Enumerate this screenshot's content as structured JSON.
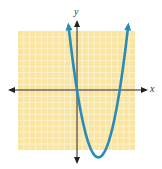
{
  "chart_data": {
    "type": "line",
    "title": "",
    "xlabel": "x",
    "ylabel": "y",
    "function": "y = x^2 - 7x",
    "xlim": [
      -10,
      10
    ],
    "ylim": [
      -10,
      10
    ],
    "grid": true,
    "legend": null,
    "series": [
      {
        "name": "parabola",
        "x": [
          -1.5,
          -1,
          0,
          1,
          2,
          3,
          3.5,
          4,
          5,
          6,
          7,
          8,
          8.5
        ],
        "values": [
          12.75,
          8,
          0,
          -6,
          -10,
          -12,
          -12.25,
          -12,
          -10,
          -6,
          0,
          8,
          12.75
        ]
      }
    ],
    "roots": [
      0,
      7
    ],
    "vertex": [
      3.5,
      -12.25
    ]
  },
  "colors": {
    "grid_bg": "#f9e4a0",
    "grid_line": "#fdf5d8",
    "curve": "#2a8ab8",
    "axis": "#222222"
  },
  "labels": {
    "x_axis": "x",
    "y_axis": "y"
  }
}
